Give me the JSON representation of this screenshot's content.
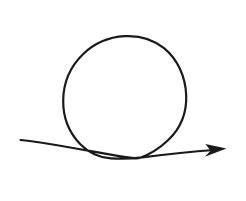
{
  "canvas": {
    "width": 246,
    "height": 201,
    "background_color": "#ffffff",
    "title": "Loop arrow"
  },
  "figure": {
    "name": "looping-arrow",
    "stroke_color": "#1a1a1a",
    "stroke_width": 2.2,
    "line_cap": "round",
    "fill": "none",
    "parts": [
      {
        "name": "tail-and-loop",
        "role": "main curve",
        "path": "M 20.5 140.0 C 46 142.5 86 150.5 126 157.2 C 133 158.4 137 158.8 139.5 158.0 C 150 154.5 160 148.0 168.5 139.8 C 180.5 128.2 186.8 112.5 186.2 95.5 C 185.6 77.0 177.6 59.2 164.0 48.2 C 152.8 39.2 138.6 35.4 124.6 36.2 C 109.0 37.1 94.2 43.4 83.0 54.2 C 70.6 66.2 63.4 83.0 63.2 100.4 C 63.0 117.2 69.4 133.0 80.6 144.4 C 88.8 152.7 99.5 157.6 110.8 158.3 C 120.0 158.9 129.5 158.9 140.0 157.6 C 165.0 154.5 192.0 151.6 214.0 150.0"
      },
      {
        "name": "arrowhead",
        "role": "terminator",
        "shape": "barbed-triangle",
        "fill_color": "#1a1a1a",
        "tip_x": 226.5,
        "tip_y": 148.6,
        "path": "M 226.5 148.6 L 204.8 156.8 L 210.6 150.8 L 205.4 144.0 Z"
      }
    ],
    "geometry": {
      "tail_start_x": 20.5,
      "tail_start_y": 140.0,
      "crossing_x": 135.0,
      "crossing_y": 158.0,
      "loop_center_x": 124.7,
      "loop_center_y": 97.2,
      "loop_radius_x": 61.5,
      "loop_radius_y": 61.0,
      "loop_top_y": 36.2,
      "loop_left_x": 63.2,
      "loop_right_x": 186.2,
      "loop_direction": "counterclockwise",
      "arrow_tip_x": 226.5,
      "arrow_tip_y": 148.6
    }
  }
}
